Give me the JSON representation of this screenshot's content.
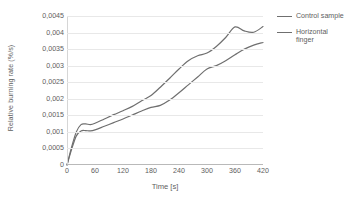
{
  "chart_data": {
    "type": "line",
    "title": "",
    "xlabel": "Time [s]",
    "ylabel": "Relative burning rate (%/s)",
    "xlim": [
      0,
      420
    ],
    "ylim": [
      0,
      0.0045
    ],
    "xticks": [
      "0",
      "60",
      "120",
      "180",
      "240",
      "300",
      "360",
      "420"
    ],
    "xtick_values": [
      0,
      60,
      120,
      180,
      240,
      300,
      360,
      420
    ],
    "yticks": [
      "0",
      "0,0005",
      "0,001",
      "0,0015",
      "0,002",
      "0,0025",
      "0,003",
      "0,0035",
      "0,004",
      "0,0045"
    ],
    "ytick_values": [
      0,
      0.0005,
      0.001,
      0.0015,
      0.002,
      0.0025,
      0.003,
      0.0035,
      0.004,
      0.0045
    ],
    "grid": "horizontal",
    "legend_position": "right",
    "decimal_separator": ",",
    "x": [
      0,
      10,
      20,
      30,
      40,
      50,
      60,
      80,
      100,
      120,
      140,
      160,
      180,
      200,
      220,
      240,
      260,
      280,
      300,
      320,
      340,
      360,
      380,
      400,
      420
    ],
    "series": [
      {
        "name": "Control sample",
        "color": "#6f6f6f",
        "values": [
          0,
          0.00055,
          0.001,
          0.00122,
          0.00124,
          0.00122,
          0.00126,
          0.00139,
          0.00152,
          0.00164,
          0.00177,
          0.00194,
          0.0021,
          0.00235,
          0.00262,
          0.0029,
          0.00315,
          0.0033,
          0.00338,
          0.00358,
          0.00385,
          0.00417,
          0.00405,
          0.00401,
          0.00418
        ]
      },
      {
        "name": "Horizontal finger",
        "color": "#6f6f6f",
        "values": [
          0,
          0.00048,
          0.00088,
          0.00103,
          0.00104,
          0.00103,
          0.00106,
          0.00117,
          0.00128,
          0.00139,
          0.00151,
          0.00163,
          0.00174,
          0.0018,
          0.00196,
          0.00218,
          0.00242,
          0.00266,
          0.0029,
          0.003,
          0.00315,
          0.00333,
          0.0035,
          0.00362,
          0.0037
        ]
      }
    ]
  },
  "legend": {
    "items": [
      {
        "label": "Control sample"
      },
      {
        "label": "Horizontal finger"
      }
    ]
  }
}
